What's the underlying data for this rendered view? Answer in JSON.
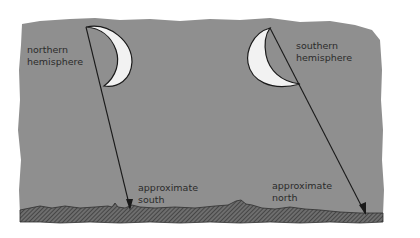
{
  "diagram": {
    "background_color": "#ffffff",
    "sky_color": "#8f8f8f",
    "ground_color": "#4a4a4a",
    "moon_color": "#f2f2f2",
    "line_color": "#1a1a1a",
    "panels": [
      {
        "id": "northern",
        "label_lines": [
          "northern",
          "hemisphere"
        ],
        "direction_lines": [
          "approximate",
          "south"
        ]
      },
      {
        "id": "southern",
        "label_lines": [
          "southern",
          "hemisphere"
        ],
        "direction_lines": [
          "approximate",
          "north"
        ]
      }
    ]
  }
}
